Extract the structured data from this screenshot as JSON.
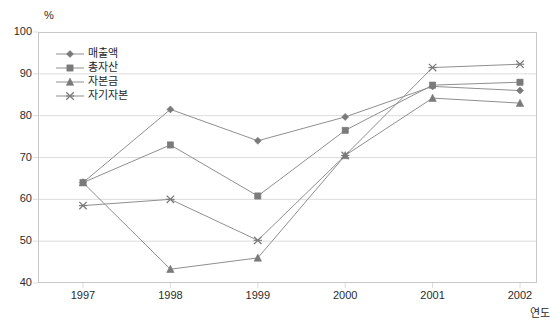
{
  "chart_data": {
    "type": "line",
    "title": "",
    "subtitle": "",
    "xlabel": "연도",
    "ylabel": "%",
    "unit_label": "%",
    "categories": [
      "1997",
      "1998",
      "1999",
      "2000",
      "2001",
      "2002"
    ],
    "x": [
      1997,
      1998,
      1999,
      2000,
      2001,
      2002
    ],
    "xlim": [
      1997,
      2002
    ],
    "ylim": [
      40,
      100
    ],
    "yticks": [
      40,
      50,
      60,
      70,
      80,
      90,
      100
    ],
    "ytick_labels": [
      "40",
      "50",
      "60",
      "70",
      "80",
      "90",
      "100"
    ],
    "grid": true,
    "grid_axis": "y",
    "legend_position": "upper-left-inside",
    "series": [
      {
        "name": "매출액",
        "marker": "diamond",
        "color": "#8c8c8c",
        "values": [
          64.0,
          81.5,
          74.0,
          79.7,
          87.0,
          86.0
        ]
      },
      {
        "name": "총자산",
        "marker": "square",
        "color": "#8c8c8c",
        "values": [
          64.0,
          73.0,
          60.8,
          76.5,
          87.3,
          88.0
        ]
      },
      {
        "name": "자본금",
        "marker": "triangle",
        "color": "#8c8c8c",
        "values": [
          64.0,
          43.3,
          46.0,
          70.5,
          84.2,
          83.0
        ]
      },
      {
        "name": "자기자본",
        "marker": "x",
        "color": "#8c8c8c",
        "values": [
          58.5,
          60.0,
          50.2,
          70.5,
          91.5,
          92.3
        ]
      }
    ]
  },
  "style": {
    "axis_color": "#c8c8c8",
    "grid_color": "#dcdcdc",
    "line_color": "#8f8f8f",
    "marker_color": "#7a7a7a",
    "text_color": "#2b2b2b",
    "background": "#ffffff"
  }
}
